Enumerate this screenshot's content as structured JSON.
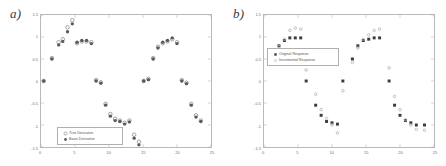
{
  "figure": {
    "panels": [
      {
        "label": "a)",
        "name": "panel-a",
        "legend_position": "bottom-left",
        "chart_key": 0
      },
      {
        "label": "b)",
        "name": "panel-b",
        "legend_position": "upper-middle",
        "chart_key": 1
      }
    ]
  },
  "chart_data": [
    {
      "type": "scatter",
      "title": "",
      "xlabel": "",
      "ylabel": "",
      "xlim": [
        0,
        25
      ],
      "ylim": [
        -1.5,
        1.5
      ],
      "xticks": [
        0,
        5,
        10,
        15,
        20,
        25
      ],
      "xticklabels": [
        "0",
        "5",
        "10",
        "15",
        "20",
        "25"
      ],
      "yticks": [
        -1.5,
        -1,
        -0.5,
        0,
        0.5,
        1,
        1.5
      ],
      "yticklabels": [
        "-1.5",
        "-1",
        "-0.5",
        "0",
        "0.5",
        "1",
        "1.5"
      ],
      "grid": false,
      "legend": [
        "True Derivative",
        "Basis Derivative"
      ],
      "legend_loc": "lower left",
      "series": [
        {
          "name": "True Derivative",
          "marker": "open-circle",
          "color": "#8d8d8d",
          "x": [
            0.4,
            1.6,
            2.6,
            3.2,
            3.9,
            4.6,
            5.3,
            6.0,
            6.7,
            7.4,
            8.1,
            8.8,
            9.5,
            10.2,
            10.9,
            11.6,
            12.3,
            13.0,
            13.7,
            14.4,
            15.1,
            15.8,
            16.5,
            17.2,
            17.9,
            18.6,
            19.3,
            20.0,
            20.7,
            21.4,
            22.1,
            22.8,
            23.5
          ],
          "y": [
            0.0,
            0.52,
            0.88,
            0.95,
            1.22,
            1.38,
            0.86,
            0.9,
            0.9,
            0.88,
            0.02,
            -0.03,
            -0.52,
            -0.75,
            -0.86,
            -0.9,
            -0.95,
            -0.9,
            -1.22,
            -1.38,
            0.0,
            0.05,
            0.52,
            0.78,
            0.86,
            0.9,
            0.95,
            0.88,
            0.02,
            -0.04,
            -0.52,
            -0.78,
            -0.9
          ]
        },
        {
          "name": "Basis Derivative",
          "marker": "filled-circle",
          "color": "#5a5a5a",
          "x": [
            0.4,
            1.6,
            2.6,
            3.2,
            3.9,
            4.6,
            5.3,
            6.0,
            6.7,
            7.4,
            8.1,
            8.8,
            9.5,
            10.2,
            10.9,
            11.6,
            12.3,
            13.0,
            13.7,
            14.4,
            15.1,
            15.8,
            16.5,
            17.2,
            17.9,
            18.6,
            19.3,
            20.0,
            20.7,
            21.4,
            22.1,
            22.8,
            23.5
          ],
          "y": [
            0.0,
            0.5,
            0.82,
            0.9,
            1.12,
            1.3,
            0.88,
            0.92,
            0.92,
            0.85,
            0.0,
            -0.05,
            -0.55,
            -0.8,
            -0.9,
            -0.92,
            -0.98,
            -0.93,
            -1.3,
            -1.45,
            0.0,
            0.03,
            0.5,
            0.75,
            0.88,
            0.92,
            0.98,
            0.85,
            0.0,
            -0.06,
            -0.55,
            -0.82,
            -0.92
          ]
        }
      ]
    },
    {
      "type": "scatter",
      "title": "",
      "xlabel": "",
      "ylabel": "",
      "xlim": [
        0,
        25
      ],
      "ylim": [
        -1.5,
        1.5
      ],
      "xticks": [
        0,
        5,
        10,
        15,
        20,
        25
      ],
      "xticklabels": [
        "0",
        "5",
        "10",
        "15",
        "20",
        "25"
      ],
      "yticks": [
        -1.5,
        -1,
        -0.5,
        0,
        0.5,
        1,
        1.5
      ],
      "yticklabels": [
        "-1.5",
        "-1",
        "-0.5",
        "0",
        "0.5",
        "1",
        "1.5"
      ],
      "grid": false,
      "legend": [
        "Original Response",
        "Incremental Response"
      ],
      "legend_loc": "upper center",
      "series": [
        {
          "name": "Original Response",
          "marker": "filled-square",
          "color": "#3c3c3c",
          "x": [
            0.8,
            2.2,
            3.0,
            3.8,
            4.6,
            5.4,
            6.2,
            7.6,
            8.4,
            9.2,
            10.0,
            10.8,
            11.6,
            13.0,
            13.8,
            14.6,
            15.4,
            16.2,
            17.0,
            18.4,
            19.2,
            20.0,
            20.8,
            21.6,
            22.4,
            23.6
          ],
          "y": [
            0.5,
            0.8,
            0.92,
            0.98,
            0.98,
            0.98,
            0.0,
            -0.55,
            -0.78,
            -0.92,
            -0.95,
            -0.98,
            0.0,
            0.5,
            0.8,
            0.92,
            0.95,
            0.98,
            0.98,
            0.0,
            -0.55,
            -0.78,
            -0.9,
            -0.95,
            -1.0,
            -1.0
          ]
        },
        {
          "name": "Incremental Response",
          "marker": "open-dot",
          "color": "#b3b3b3",
          "x": [
            0.8,
            2.2,
            3.0,
            3.8,
            4.6,
            5.4,
            6.2,
            7.6,
            8.4,
            9.2,
            10.0,
            10.8,
            11.6,
            13.0,
            13.8,
            14.6,
            15.4,
            16.2,
            17.0,
            18.4,
            19.2,
            20.0,
            20.8,
            21.6,
            22.4,
            23.6
          ],
          "y": [
            0.5,
            0.78,
            0.95,
            1.15,
            1.2,
            1.18,
            0.25,
            -0.3,
            -0.65,
            -0.85,
            -1.0,
            -1.18,
            -0.22,
            0.42,
            0.75,
            0.95,
            1.05,
            1.15,
            1.18,
            0.3,
            -0.35,
            -0.65,
            -0.88,
            -1.0,
            -1.1,
            -1.12
          ]
        }
      ]
    }
  ]
}
